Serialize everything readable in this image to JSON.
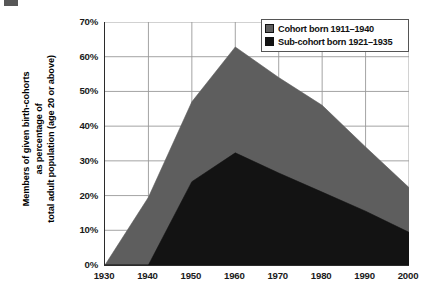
{
  "figure": {
    "background_color": "#ffffff",
    "axis_color": "#2b2b2b",
    "grid_color": "#9a9a9a"
  },
  "axes": {
    "ylabel": "Members of given birth-cohorts\nas percentage of\ntotal adult population (age 20 or above)",
    "xlabel": "",
    "y_ticks": [
      "0%",
      "10%",
      "20%",
      "30%",
      "40%",
      "50%",
      "60%",
      "70%"
    ],
    "x_ticks": [
      "1930",
      "1940",
      "1950",
      "1960",
      "1970",
      "1980",
      "1990",
      "2000"
    ]
  },
  "legend": {
    "position": "top-right",
    "entries": [
      {
        "label": "Cohort born 1911–1940",
        "color": "#5e5e5e",
        "swatch": "legend-swatch-gray"
      },
      {
        "label": "Sub-cohort born 1921–1935",
        "color": "#131313",
        "swatch": "legend-swatch-black"
      }
    ]
  },
  "chart_data": {
    "type": "area",
    "title": "",
    "xlabel": "",
    "ylabel": "Members of given birth-cohorts as percentage of total adult population (age 20 or above)",
    "x": [
      1930,
      1940,
      1950,
      1960,
      1970,
      1980,
      1990,
      2000
    ],
    "xlim": [
      1930,
      2000
    ],
    "ylim": [
      0,
      70
    ],
    "y_tick_values": [
      0,
      10,
      20,
      30,
      40,
      50,
      60,
      70
    ],
    "y_unit": "percent",
    "grid": true,
    "legend_position": "top-right",
    "stacked": false,
    "series": [
      {
        "name": "Cohort born 1911–1940",
        "color": "#5e5e5e",
        "values": [
          0,
          19.5,
          47.0,
          62.8,
          54.0,
          46.0,
          34.0,
          22.3
        ]
      },
      {
        "name": "Sub-cohort born 1921–1935",
        "color": "#131313",
        "values": [
          0,
          0,
          24.0,
          32.3,
          26.5,
          21.0,
          15.5,
          9.4
        ]
      }
    ]
  }
}
